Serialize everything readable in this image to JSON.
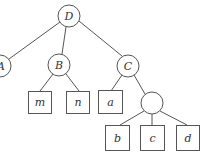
{
  "diagram": {
    "type": "tree",
    "colors": {
      "stroke": "#555555",
      "label": "#333333",
      "background": "#ffffff"
    },
    "nodes": [
      {
        "id": "D",
        "label": "D",
        "shape": "circle",
        "cx": 69,
        "cy": 16,
        "r": 11
      },
      {
        "id": "A",
        "label": "A",
        "shape": "circle",
        "cx": 0,
        "cy": 66,
        "r": 11
      },
      {
        "id": "B",
        "label": "B",
        "shape": "circle",
        "cx": 59,
        "cy": 65,
        "r": 11
      },
      {
        "id": "C",
        "label": "C",
        "shape": "circle",
        "cx": 128,
        "cy": 66,
        "r": 11
      },
      {
        "id": "m",
        "label": "m",
        "shape": "box",
        "x": 28,
        "y": 91,
        "w": 23,
        "h": 22
      },
      {
        "id": "n",
        "label": "n",
        "shape": "box",
        "x": 66,
        "y": 91,
        "w": 23,
        "h": 22
      },
      {
        "id": "a",
        "label": "a",
        "shape": "box",
        "x": 98,
        "y": 91,
        "w": 24,
        "h": 23
      },
      {
        "id": "E",
        "label": "",
        "shape": "circle",
        "cx": 152,
        "cy": 103,
        "r": 11
      },
      {
        "id": "b",
        "label": "b",
        "shape": "box",
        "x": 105,
        "y": 125,
        "w": 24,
        "h": 25
      },
      {
        "id": "c",
        "label": "c",
        "shape": "box",
        "x": 140,
        "y": 125,
        "w": 24,
        "h": 25
      },
      {
        "id": "d",
        "label": "d",
        "shape": "box",
        "x": 176,
        "y": 125,
        "w": 23,
        "h": 25
      }
    ],
    "edges": [
      {
        "from": "D",
        "to": "A"
      },
      {
        "from": "D",
        "to": "B"
      },
      {
        "from": "D",
        "to": "C"
      },
      {
        "from": "B",
        "to": "m"
      },
      {
        "from": "B",
        "to": "n"
      },
      {
        "from": "C",
        "to": "a"
      },
      {
        "from": "C",
        "to": "E"
      },
      {
        "from": "E",
        "to": "b"
      },
      {
        "from": "E",
        "to": "c"
      },
      {
        "from": "E",
        "to": "d"
      }
    ]
  }
}
